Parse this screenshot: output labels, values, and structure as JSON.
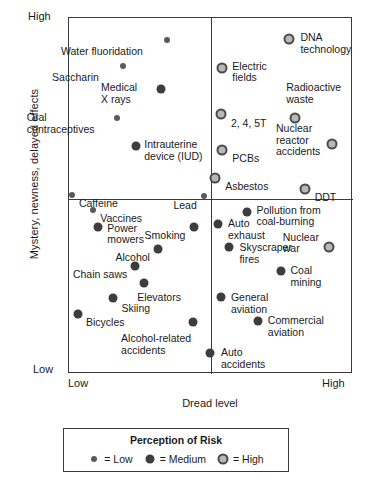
{
  "chart_data": {
    "type": "scatter",
    "title": "",
    "xlabel": "Dread level",
    "ylabel": "Mystery, newness, delayed effects",
    "x_tick_labels": [
      "Low",
      "High"
    ],
    "y_tick_labels": [
      "Low",
      "High"
    ],
    "xlim": [
      0,
      100
    ],
    "ylim": [
      0,
      100
    ],
    "grid": false,
    "quadrant_dividers": {
      "x": 50,
      "y": 49
    },
    "legend": {
      "title": "Perception of Risk",
      "position": "below-plot",
      "entries": [
        {
          "marker": "low",
          "label": "= Low"
        },
        {
          "marker": "medium",
          "label": "= Medium"
        },
        {
          "marker": "high",
          "label": "= High"
        }
      ]
    },
    "points": [
      {
        "label": "Water fluoridation",
        "x": 34.5,
        "y": 93.8,
        "risk": "low",
        "label_align": "right",
        "lx": 26.0,
        "ly": 92.0
      },
      {
        "label": "Saccharin",
        "x": 19.0,
        "y": 86.5,
        "risk": "low",
        "label_align": "right",
        "lx": 10.5,
        "ly": 84.8
      },
      {
        "label": "Medical\nX rays",
        "x": 32.4,
        "y": 80.1,
        "risk": "medium",
        "label_align": "right",
        "lx": 24.0,
        "ly": 82.0
      },
      {
        "label": "Oral\ncontraceptives",
        "x": 16.9,
        "y": 71.9,
        "risk": "low",
        "label_align": "right",
        "lx": 9.0,
        "ly": 73.5
      },
      {
        "label": "Intrauterine\ndevice (IUD)",
        "x": 23.6,
        "y": 64.0,
        "risk": "medium",
        "label_align": "left",
        "lx": 26.5,
        "ly": 66.0
      },
      {
        "label": "Caffeine",
        "x": 1.1,
        "y": 50.3,
        "risk": "low",
        "label_align": "left",
        "lx": 3.5,
        "ly": 49.4
      },
      {
        "label": "Lead",
        "x": 47.5,
        "y": 49.9,
        "risk": "low",
        "label_align": "right",
        "lx": 45.0,
        "ly": 49.0
      },
      {
        "label": "Vaccines",
        "x": 8.5,
        "y": 46.1,
        "risk": "low",
        "label_align": "left",
        "lx": 11.0,
        "ly": 45.2
      },
      {
        "label": "Electric\nfields",
        "x": 53.9,
        "y": 86.0,
        "risk": "high",
        "label_align": "left",
        "lx": 57.5,
        "ly": 88.0
      },
      {
        "label": "DNA\ntechnology",
        "x": 77.5,
        "y": 94.0,
        "risk": "high",
        "label_align": "left",
        "lx": 81.5,
        "ly": 96.0
      },
      {
        "label": "Radioactive\nwaste",
        "x": 79.6,
        "y": 72.0,
        "risk": "high",
        "label_align": "left",
        "lx": 76.5,
        "ly": 82.0
      },
      {
        "label": "2, 4, 5T",
        "x": 53.5,
        "y": 73.0,
        "risk": "high",
        "label_align": "left",
        "lx": 57.0,
        "ly": 72.0
      },
      {
        "label": "Nuclear\nreactor\naccidents",
        "x": 92.5,
        "y": 64.5,
        "risk": "high",
        "label_align": "right",
        "lx": 88.5,
        "ly": 70.5
      },
      {
        "label": "PCBs",
        "x": 53.8,
        "y": 63.0,
        "risk": "high",
        "label_align": "left",
        "lx": 57.5,
        "ly": 62.2
      },
      {
        "label": "Asbestos",
        "x": 51.3,
        "y": 55.0,
        "risk": "high",
        "label_align": "left",
        "lx": 55.0,
        "ly": 54.2
      },
      {
        "label": "DDT",
        "x": 83.0,
        "y": 52.0,
        "risk": "high",
        "label_align": "left",
        "lx": 86.5,
        "ly": 51.2
      },
      {
        "label": "Pollution from\ncoal-burning",
        "x": 62.5,
        "y": 45.5,
        "risk": "medium",
        "label_align": "left",
        "lx": 66.0,
        "ly": 47.5
      },
      {
        "label": "Power\nmowers",
        "x": 10.2,
        "y": 41.2,
        "risk": "medium",
        "label_align": "left",
        "lx": 13.5,
        "ly": 42.5
      },
      {
        "label": "Smoking",
        "x": 44.0,
        "y": 41.2,
        "risk": "medium",
        "label_align": "right",
        "lx": 41.0,
        "ly": 40.5
      },
      {
        "label": "Alcohol",
        "x": 31.5,
        "y": 35.0,
        "risk": "medium",
        "label_align": "right",
        "lx": 28.5,
        "ly": 34.2
      },
      {
        "label": "Chain saws",
        "x": 23.2,
        "y": 30.2,
        "risk": "medium",
        "label_align": "right",
        "lx": 20.5,
        "ly": 29.4
      },
      {
        "label": "Elevators",
        "x": 26.5,
        "y": 25.6,
        "risk": "medium",
        "label_align": "left",
        "lx": 24.0,
        "ly": 23.0
      },
      {
        "label": "Skiing",
        "x": 15.5,
        "y": 21.4,
        "risk": "medium",
        "label_align": "left",
        "lx": 18.5,
        "ly": 20.0
      },
      {
        "label": "Bicycles",
        "x": 3.0,
        "y": 16.8,
        "risk": "medium",
        "label_align": "left",
        "lx": 6.0,
        "ly": 16.0
      },
      {
        "label": "Alcohol-related\naccidents",
        "x": 43.5,
        "y": 14.5,
        "risk": "medium",
        "label_align": "right",
        "lx": 43.0,
        "ly": 11.5
      },
      {
        "label": "Auto\nexhaust",
        "x": 52.5,
        "y": 42.2,
        "risk": "medium",
        "label_align": "left",
        "lx": 56.0,
        "ly": 43.8
      },
      {
        "label": "Skyscraper\nfires",
        "x": 56.5,
        "y": 35.6,
        "risk": "medium",
        "label_align": "left",
        "lx": 60.0,
        "ly": 37.0
      },
      {
        "label": "Nuclear\nwar",
        "x": 91.5,
        "y": 35.6,
        "risk": "high",
        "label_align": "right",
        "lx": 88.0,
        "ly": 40.0
      },
      {
        "label": "Coal\nmining",
        "x": 74.5,
        "y": 29.0,
        "risk": "medium",
        "label_align": "left",
        "lx": 78.0,
        "ly": 30.5
      },
      {
        "label": "General\naviation",
        "x": 53.5,
        "y": 21.5,
        "risk": "medium",
        "label_align": "left",
        "lx": 57.0,
        "ly": 23.0
      },
      {
        "label": "Commercial\naviation",
        "x": 66.5,
        "y": 15.0,
        "risk": "medium",
        "label_align": "left",
        "lx": 70.0,
        "ly": 16.5
      },
      {
        "label": "Auto\naccidents",
        "x": 49.8,
        "y": 6.0,
        "risk": "medium",
        "label_align": "left",
        "lx": 53.5,
        "ly": 7.5
      }
    ]
  },
  "axes": {
    "y_title": "Mystery, newness, delayed effects",
    "y_high": "High",
    "y_low": "Low",
    "x_title": "Dread level",
    "x_low": "Low",
    "x_high": "High"
  },
  "legend": {
    "title": "Perception of Risk",
    "low_label": "= Low",
    "medium_label": "= Medium",
    "high_label": "= High"
  },
  "colors": {
    "frame": "#3a3a3a",
    "low_marker": "#5a5a5a",
    "medium_marker": "#3d3d3d",
    "high_marker_ring": "#4a4a4a",
    "high_marker_fill": "#b8b8b8",
    "text": "#1a1a1a",
    "background": "#ffffff"
  }
}
